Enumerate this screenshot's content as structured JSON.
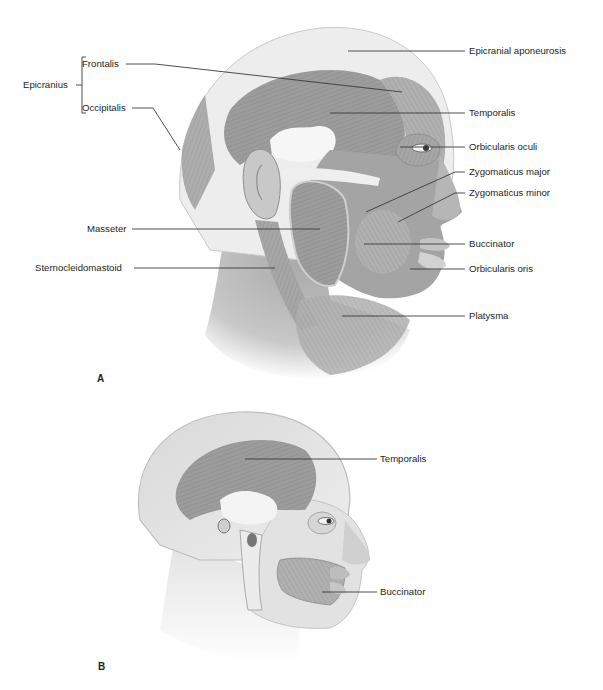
{
  "figure": {
    "panels": [
      {
        "id": "A",
        "letter": "A",
        "description": "Lateral view of head showing superficial muscles of the head and neck",
        "labels": {
          "epicranius": "Epicranius",
          "frontalis": "Frontalis",
          "occipitalis": "Occipitalis",
          "epicranial_aponeurosis": "Epicranial aponeurosis",
          "temporalis": "Temporalis",
          "orbicularis_oculi": "Orbicularis oculi",
          "zygomaticus_major": "Zygomaticus major",
          "zygomaticus_minor": "Zygomaticus minor",
          "masseter": "Masseter",
          "buccinator": "Buccinator",
          "sternocleidomastoid": "Sternocleidomastoid",
          "orbicularis_oris": "Orbicularis oris",
          "platysma": "Platysma"
        }
      },
      {
        "id": "B",
        "letter": "B",
        "description": "Lateral view of head showing deeper muscles (temporalis and buccinator) over skull",
        "labels": {
          "temporalis": "Temporalis",
          "buccinator": "Buccinator"
        }
      }
    ],
    "colors": {
      "text": "#231f20",
      "leader_line": "#3a3a3a",
      "muscle_gray": "#9a9a9a",
      "skin_light": "#e4e4e4",
      "tendon_white": "#f6f6f6"
    }
  },
  "panelA": {
    "letter": "A",
    "epicranius": "Epicranius",
    "frontalis": "Frontalis",
    "occipitalis": "Occipitalis",
    "epicranial_aponeurosis": "Epicranial aponeurosis",
    "temporalis": "Temporalis",
    "orbicularis_oculi": "Orbicularis oculi",
    "zygomaticus_major": "Zygomaticus major",
    "zygomaticus_minor": "Zygomaticus minor",
    "masseter": "Masseter",
    "buccinator": "Buccinator",
    "sternocleidomastoid": "Sternocleidomastoid",
    "orbicularis_oris": "Orbicularis oris",
    "platysma": "Platysma"
  },
  "panelB": {
    "letter": "B",
    "temporalis": "Temporalis",
    "buccinator": "Buccinator"
  }
}
